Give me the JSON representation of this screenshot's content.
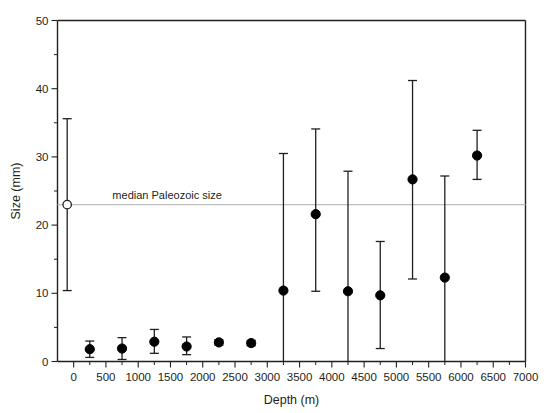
{
  "chart_data": {
    "type": "scatter",
    "title": "",
    "xlabel": "Depth (m)",
    "ylabel": "Size (mm)",
    "xlim": [
      -250,
      7000
    ],
    "ylim": [
      0,
      50
    ],
    "xticks": [
      0,
      500,
      1000,
      1500,
      2000,
      2500,
      3000,
      3500,
      4000,
      4500,
      5000,
      5500,
      6000,
      6500,
      7000
    ],
    "xticklabels": [
      "0",
      "500",
      "1000",
      "1500",
      "2000",
      "2500",
      "3000",
      "3500",
      "4000",
      "4500",
      "5000",
      "5500",
      "6000",
      "6500",
      "7000"
    ],
    "yticks": [
      0,
      10,
      20,
      30,
      40,
      50
    ],
    "yticklabels": [
      "0",
      "10",
      "20",
      "30",
      "40",
      "50"
    ],
    "y_minor_step": 5,
    "grid": false,
    "legend": "none",
    "annotations": [
      {
        "name": "median-paleozoic-size",
        "text": "median Paleozoic size",
        "y_value": 23.0,
        "line": true,
        "line_color": "#bfbfbf",
        "label_x": 600
      }
    ],
    "marker_colors": {
      "filled": "#000000",
      "open_fill": "#ffffff",
      "open_stroke": "#231f20",
      "error_bar": "#231f20"
    },
    "series": [
      {
        "name": "Paleozoic reference",
        "marker": "open-circle",
        "points": [
          {
            "x": -100,
            "y": 23.0,
            "ylow": 10.4,
            "yhigh": 35.6
          }
        ]
      },
      {
        "name": "Modern size by depth",
        "marker": "filled-circle",
        "points": [
          {
            "x": 250,
            "y": 1.8,
            "ylow": 0.6,
            "yhigh": 3.0
          },
          {
            "x": 750,
            "y": 1.9,
            "ylow": 0.3,
            "yhigh": 3.5
          },
          {
            "x": 1250,
            "y": 2.9,
            "ylow": 1.2,
            "yhigh": 4.7
          },
          {
            "x": 1750,
            "y": 2.2,
            "ylow": 1.0,
            "yhigh": 3.6
          },
          {
            "x": 2250,
            "y": 2.8,
            "ylow": 2.4,
            "yhigh": 3.2
          },
          {
            "x": 2750,
            "y": 2.7,
            "ylow": 2.3,
            "yhigh": 3.1
          },
          {
            "x": 3250,
            "y": 10.4,
            "ylow": -10.0,
            "yhigh": 30.5
          },
          {
            "x": 3750,
            "y": 21.6,
            "ylow": 10.3,
            "yhigh": 34.1
          },
          {
            "x": 4250,
            "y": 10.3,
            "ylow": -8.0,
            "yhigh": 27.9
          },
          {
            "x": 4750,
            "y": 9.7,
            "ylow": 1.9,
            "yhigh": 17.6
          },
          {
            "x": 5250,
            "y": 26.7,
            "ylow": 12.1,
            "yhigh": 41.2
          },
          {
            "x": 5750,
            "y": 12.3,
            "ylow": -12.0,
            "yhigh": 27.2
          },
          {
            "x": 6250,
            "y": 30.2,
            "ylow": 26.7,
            "yhigh": 33.9
          }
        ]
      }
    ]
  }
}
